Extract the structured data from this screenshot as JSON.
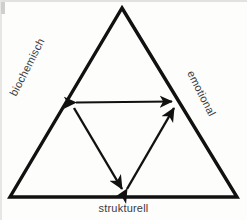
{
  "diagram": {
    "type": "triangle-relationship-diagram",
    "background_color": "#fdfdfc",
    "stroke_color": "#111111",
    "text_color": "#3b3b3b",
    "outer_triangle": {
      "name": "outer-triangle",
      "vertices": [
        {
          "id": "apex",
          "x": 122,
          "y": 8
        },
        {
          "id": "bottom-left",
          "x": 10,
          "y": 197
        },
        {
          "id": "bottom-right",
          "x": 237,
          "y": 197
        }
      ],
      "stroke_width": 3.4
    },
    "inner_arrows": [
      {
        "id": "biochemisch-emotional",
        "from": {
          "x": 71,
          "y": 103
        },
        "to": {
          "x": 177,
          "y": 101
        },
        "double_headed": true
      },
      {
        "id": "biochemisch-strukturell",
        "from": {
          "x": 71,
          "y": 104
        },
        "to": {
          "x": 124,
          "y": 194
        },
        "double_headed": false
      },
      {
        "id": "strukturell-emotional",
        "from": {
          "x": 124,
          "y": 194
        },
        "to": {
          "x": 177,
          "y": 103
        },
        "double_headed": true
      }
    ],
    "labels": {
      "left": "biochemisch",
      "right": "emotional",
      "bottom": "strukturell"
    }
  }
}
